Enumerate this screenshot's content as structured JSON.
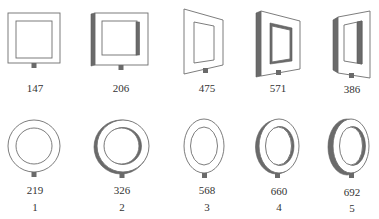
{
  "figure": {
    "colors": {
      "outline": "#6e6e6e",
      "shading": "#6a6a6a",
      "text": "#333333",
      "background": "#ffffff"
    },
    "squares": [
      {
        "id": 1,
        "value": "147",
        "shape": "flat-square-frame"
      },
      {
        "id": 2,
        "value": "206",
        "shape": "square-frame-with-depth"
      },
      {
        "id": 3,
        "value": "475",
        "shape": "perspective-square-frame"
      },
      {
        "id": 4,
        "value": "571",
        "shape": "perspective-square-frame-with-depth"
      },
      {
        "id": 5,
        "value": "386",
        "shape": "strong-perspective-square-frame-with-depth"
      }
    ],
    "circles": [
      {
        "id": 1,
        "value": "219",
        "shape": "flat-ring"
      },
      {
        "id": 2,
        "value": "326",
        "shape": "ring-with-depth"
      },
      {
        "id": 3,
        "value": "568",
        "shape": "perspective-ellipse-ring"
      },
      {
        "id": 4,
        "value": "660",
        "shape": "perspective-ellipse-ring-with-depth"
      },
      {
        "id": 5,
        "value": "692",
        "shape": "strong-perspective-ellipse-ring-with-depth"
      }
    ],
    "column_numbers": [
      "1",
      "2",
      "3",
      "4",
      "5"
    ]
  }
}
